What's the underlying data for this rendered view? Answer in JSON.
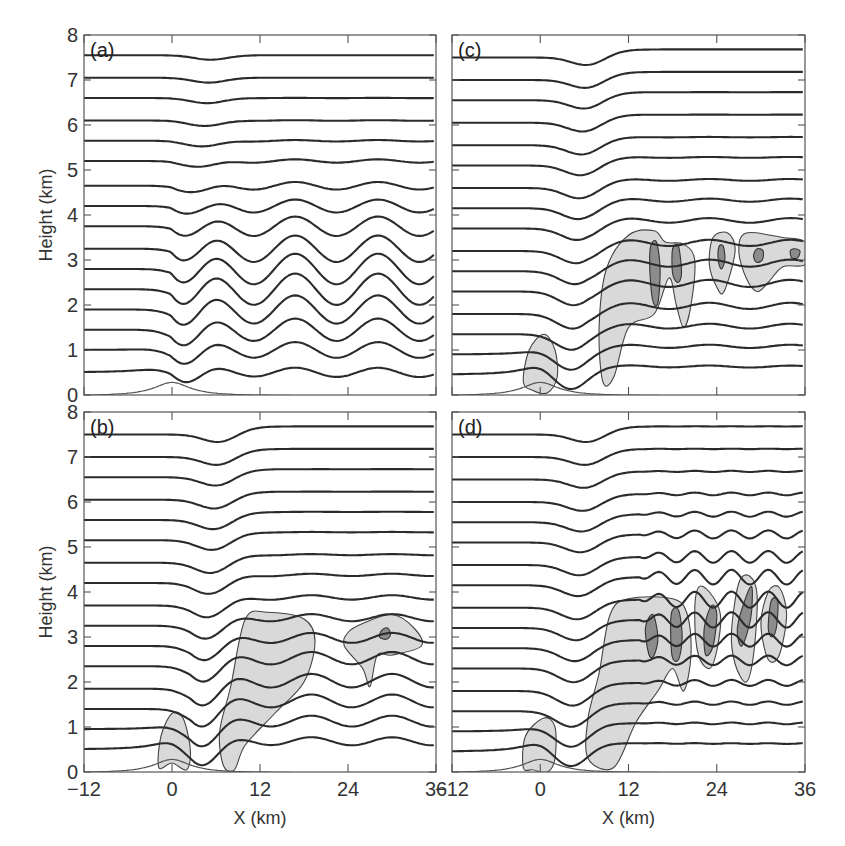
{
  "chart_data": [
    {
      "type": "line",
      "panel": "(a)",
      "title": "",
      "xlabel": "",
      "ylabel": "Height (km)",
      "xlim": [
        -12,
        36
      ],
      "ylim": [
        0,
        8
      ],
      "xticks": [
        -12,
        0,
        12,
        24,
        36
      ],
      "yticks": [
        0,
        1,
        2,
        3,
        4,
        5,
        6,
        7,
        8
      ],
      "grid": false,
      "description": "Streamlines over a bell-shaped mountain at x=0; trapped lee waves with wavelength ~11 km, strongest amplitude near 2-3 km; no cloud shading",
      "terrain": {
        "center_km": 0,
        "peak_height_km": 0.3,
        "half_width_km": 3
      },
      "streamline_base_heights_km": [
        0.5,
        1.0,
        1.45,
        1.9,
        2.35,
        2.8,
        3.25,
        3.75,
        4.2,
        4.65,
        5.2,
        5.65,
        6.1,
        6.6,
        7.05,
        7.55
      ],
      "lee_wave": {
        "wavelength_km": 11.3,
        "first_crest_km": 5.5,
        "max_amplitude_km": 0.35,
        "amplitude_peak_height_km": 2.5
      },
      "clouds_light": [],
      "clouds_dark": []
    },
    {
      "type": "line",
      "panel": "(b)",
      "title": "",
      "xlabel": "X (km)",
      "ylabel": "Height (km)",
      "xlim": [
        -12,
        36
      ],
      "ylim": [
        0,
        8
      ],
      "xticks": [
        -12,
        0,
        12,
        24,
        36
      ],
      "yticks": [
        0,
        1,
        2,
        3,
        4,
        5,
        6,
        7,
        8
      ],
      "grid": false,
      "description": "Streamlines with lee waves plus cloud regions (light shading) near mountain top, a large cloud from x~7-20 km up to 3.5 km, and a cloud at x~24-34 km around 2-3.5 km with a small dark core near x=29, z=3.1",
      "terrain": {
        "center_km": 0,
        "peak_height_km": 0.3,
        "half_width_km": 3
      },
      "streamline_base_heights_km": [
        0.5,
        0.95,
        1.4,
        1.85,
        2.35,
        2.8,
        3.25,
        3.7,
        4.2,
        4.65,
        5.15,
        5.6,
        6.05,
        6.55,
        7.0,
        7.5
      ],
      "lee_wave": {
        "wavelength_km": 11,
        "first_crest_km": 8,
        "max_amplitude_km": 0.15,
        "amplitude_peak_height_km": 1.8
      },
      "clouds_light": [
        [
          [
            -1.8,
            0.1
          ],
          [
            -1.5,
            0.8
          ],
          [
            0,
            1.3
          ],
          [
            1.5,
            1.2
          ],
          [
            2.5,
            0.5
          ],
          [
            2,
            0.05
          ],
          [
            0,
            0.2
          ]
        ],
        [
          [
            7,
            0.15
          ],
          [
            6.5,
            0.9
          ],
          [
            8,
            1.9
          ],
          [
            10,
            3.4
          ],
          [
            13,
            3.55
          ],
          [
            18,
            3.4
          ],
          [
            19.5,
            2.9
          ],
          [
            18,
            2.0
          ],
          [
            14,
            1.3
          ],
          [
            10,
            0.6
          ],
          [
            8.5,
            0.05
          ]
        ],
        [
          [
            23.5,
            2.8
          ],
          [
            24,
            3.1
          ],
          [
            26,
            3.3
          ],
          [
            30,
            3.5
          ],
          [
            33,
            3.2
          ],
          [
            34,
            2.8
          ],
          [
            30,
            2.6
          ],
          [
            28,
            2.6
          ],
          [
            27,
            1.9
          ],
          [
            26,
            2.3
          ]
        ]
      ],
      "clouds_dark": [
        [
          [
            28.3,
            3.0
          ],
          [
            28.6,
            3.15
          ],
          [
            29.4,
            3.2
          ],
          [
            29.8,
            3.05
          ],
          [
            29.2,
            2.95
          ]
        ]
      ]
    },
    {
      "type": "line",
      "panel": "(c)",
      "title": "",
      "xlabel": "",
      "ylabel": "",
      "xlim": [
        -12,
        36
      ],
      "ylim": [
        0,
        8
      ],
      "xticks": [
        -12,
        0,
        12,
        24,
        36
      ],
      "yticks": [
        0,
        1,
        2,
        3,
        4,
        5,
        6,
        7,
        8
      ],
      "grid": false,
      "description": "Streamlines with a dip over x~8 km; light cloud over mountain, large cloud x~7-14 km up to 3.6 km extending right along 2.5-3.5 km to x=36; dark cores at x~15.5 (2-3.4 km), 18.5, 24.5, 29.5, 34.5 near 3.0-3.2 km",
      "terrain": {
        "center_km": 0,
        "peak_height_km": 0.3,
        "half_width_km": 3
      },
      "streamline_base_heights_km": [
        0.45,
        0.9,
        1.35,
        1.8,
        2.3,
        2.75,
        3.2,
        3.7,
        4.15,
        4.6,
        5.1,
        5.55,
        6.05,
        6.55,
        7.0,
        7.5
      ],
      "lee_wave": {
        "wavelength_km": 11,
        "first_crest_km": 12,
        "max_amplitude_km": 0.08,
        "amplitude_peak_height_km": 2.5
      },
      "clouds_light": [
        [
          [
            -2.3,
            0.3
          ],
          [
            -1.5,
            1.0
          ],
          [
            0.5,
            1.35
          ],
          [
            2,
            1.0
          ],
          [
            2.3,
            0.4
          ],
          [
            1,
            0.05
          ],
          [
            -1,
            0.1
          ]
        ],
        [
          [
            8.5,
            0.3
          ],
          [
            8,
            1.5
          ],
          [
            9,
            2.8
          ],
          [
            12,
            3.55
          ],
          [
            15.5,
            3.65
          ],
          [
            17,
            3.4
          ],
          [
            19.5,
            3.35
          ],
          [
            21,
            3.0
          ],
          [
            20.5,
            2.0
          ],
          [
            19.5,
            1.5
          ],
          [
            18.5,
            2.0
          ],
          [
            17.5,
            2.6
          ],
          [
            15.5,
            1.8
          ],
          [
            12,
            1.5
          ],
          [
            10,
            0.4
          ]
        ],
        [
          [
            23,
            2.9
          ],
          [
            23.5,
            3.5
          ],
          [
            25.5,
            3.6
          ],
          [
            26.5,
            3.2
          ],
          [
            25,
            2.3
          ],
          [
            24,
            2.4
          ]
        ],
        [
          [
            27,
            3.2
          ],
          [
            28,
            3.6
          ],
          [
            33,
            3.5
          ],
          [
            36,
            3.4
          ],
          [
            36,
            2.9
          ],
          [
            33,
            2.85
          ],
          [
            31,
            2.5
          ],
          [
            29.5,
            2.3
          ],
          [
            28,
            2.6
          ]
        ]
      ],
      "clouds_dark": [
        [
          [
            15,
            3.3
          ],
          [
            15.8,
            3.4
          ],
          [
            16.3,
            2.8
          ],
          [
            16,
            2.05
          ],
          [
            15.3,
            2.1
          ],
          [
            14.9,
            2.8
          ]
        ],
        [
          [
            18,
            3.25
          ],
          [
            18.8,
            3.3
          ],
          [
            19.2,
            2.7
          ],
          [
            18.7,
            2.5
          ],
          [
            18,
            2.7
          ]
        ],
        [
          [
            24.3,
            3.3
          ],
          [
            24.9,
            3.3
          ],
          [
            25.1,
            3.0
          ],
          [
            24.6,
            2.8
          ],
          [
            24.2,
            3.0
          ]
        ],
        [
          [
            29,
            3.1
          ],
          [
            29.5,
            3.25
          ],
          [
            30.3,
            3.2
          ],
          [
            30.2,
            3.0
          ],
          [
            29.4,
            2.95
          ]
        ],
        [
          [
            34,
            3.2
          ],
          [
            34.5,
            3.25
          ],
          [
            35.3,
            3.2
          ],
          [
            35,
            3.05
          ],
          [
            34.2,
            3.05
          ]
        ]
      ]
    },
    {
      "type": "line",
      "panel": "(d)",
      "title": "",
      "xlabel": "X (km)",
      "ylabel": "",
      "xlim": [
        -12,
        36
      ],
      "ylim": [
        0,
        8
      ],
      "xticks": [
        -12,
        0,
        12,
        24,
        36
      ],
      "yticks": [
        0,
        1,
        2,
        3,
        4,
        5,
        6,
        7,
        8
      ],
      "grid": false,
      "description": "Streamlines with deep lee disturbance; large light cloud x~6-20 km up to 3.8 km with cells extending to x~34 up to 4.4 km; dark cores at x~15, 18.5, 23, 28, 31.5 between 2.5 and 4.2 km",
      "terrain": {
        "center_km": 0,
        "peak_height_km": 0.3,
        "half_width_km": 3
      },
      "streamline_base_heights_km": [
        0.45,
        0.9,
        1.35,
        1.8,
        2.3,
        2.75,
        3.2,
        3.65,
        4.15,
        4.6,
        5.1,
        5.55,
        6.0,
        6.5,
        7.0,
        7.5
      ],
      "lee_wave": {
        "wavelength_km": 5,
        "first_crest_km": 16,
        "max_amplitude_km": 0.18,
        "amplitude_peak_height_km": 3.6
      },
      "clouds_light": [
        [
          [
            -2.3,
            0.1
          ],
          [
            -2,
            0.8
          ],
          [
            0.5,
            1.2
          ],
          [
            2,
            1.0
          ],
          [
            2,
            0.3
          ],
          [
            1,
            0.0
          ],
          [
            -1,
            0.05
          ]
        ],
        [
          [
            6.5,
            0.3
          ],
          [
            6.5,
            1.2
          ],
          [
            8,
            2.2
          ],
          [
            9.5,
            3.5
          ],
          [
            12,
            3.85
          ],
          [
            18,
            3.85
          ],
          [
            20,
            3.5
          ],
          [
            20.5,
            2.6
          ],
          [
            19.5,
            1.8
          ],
          [
            18,
            2.3
          ],
          [
            16,
            1.8
          ],
          [
            13,
            1.1
          ],
          [
            10,
            0.1
          ]
        ],
        [
          [
            21,
            3.5
          ],
          [
            21.5,
            4.1
          ],
          [
            23,
            4.0
          ],
          [
            24.5,
            3.5
          ],
          [
            24,
            2.7
          ],
          [
            23,
            2.3
          ],
          [
            21.5,
            2.6
          ]
        ],
        [
          [
            26,
            3.1
          ],
          [
            27,
            4.2
          ],
          [
            28.5,
            4.35
          ],
          [
            29.5,
            3.9
          ],
          [
            29,
            2.6
          ],
          [
            28,
            2.0
          ],
          [
            26.5,
            2.4
          ]
        ],
        [
          [
            30,
            3.3
          ],
          [
            31,
            4.0
          ],
          [
            32.5,
            4.1
          ],
          [
            33.5,
            3.5
          ],
          [
            32.5,
            2.6
          ],
          [
            31,
            2.5
          ]
        ]
      ],
      "clouds_dark": [
        [
          [
            14.3,
            3.2
          ],
          [
            15.3,
            3.5
          ],
          [
            16,
            3.0
          ],
          [
            15.5,
            2.6
          ],
          [
            14.8,
            2.6
          ]
        ],
        [
          [
            17.8,
            3.5
          ],
          [
            18.8,
            3.6
          ],
          [
            19.3,
            3.0
          ],
          [
            18.8,
            2.5
          ],
          [
            17.9,
            2.6
          ]
        ],
        [
          [
            22.3,
            3.2
          ],
          [
            23.3,
            3.7
          ],
          [
            24,
            3.5
          ],
          [
            23.5,
            2.8
          ],
          [
            22.5,
            2.6
          ]
        ],
        [
          [
            26.8,
            3.2
          ],
          [
            28,
            3.9
          ],
          [
            28.8,
            4.1
          ],
          [
            28.6,
            3.4
          ],
          [
            27.4,
            2.8
          ]
        ],
        [
          [
            31,
            3.2
          ],
          [
            31.4,
            3.8
          ],
          [
            32.3,
            3.8
          ],
          [
            32.1,
            3.2
          ],
          [
            31.5,
            3.0
          ]
        ]
      ]
    }
  ],
  "panels": [
    {
      "id": "a",
      "label": "(a)",
      "show_y_labels": true,
      "show_x_labels": false,
      "ylabel": "Height (km)",
      "xlabel": ""
    },
    {
      "id": "b",
      "label": "(b)",
      "show_y_labels": true,
      "show_x_labels": true,
      "ylabel": "Height (km)",
      "xlabel": "X (km)"
    },
    {
      "id": "c",
      "label": "(c)",
      "show_y_labels": false,
      "show_x_labels": false,
      "ylabel": "",
      "xlabel": ""
    },
    {
      "id": "d",
      "label": "(d)",
      "show_y_labels": false,
      "show_x_labels": true,
      "ylabel": "",
      "xlabel": "X (km)"
    }
  ],
  "axis_tick_labels": {
    "x": [
      "−12",
      "0",
      "12",
      "24",
      "36"
    ],
    "y": [
      "0",
      "1",
      "2",
      "3",
      "4",
      "5",
      "6",
      "7",
      "8"
    ]
  },
  "colors": {
    "streamline": "#2b2b2b",
    "cloud_light": "#d9d9d9",
    "cloud_dark": "#8c8c8c",
    "frame": "#555555"
  }
}
